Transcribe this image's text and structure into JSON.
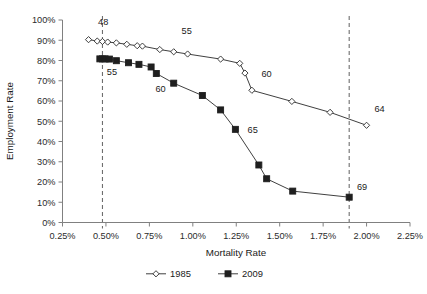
{
  "chart_data": {
    "type": "line",
    "title": "",
    "xlabel": "Mortality Rate",
    "ylabel": "Employment Rate",
    "xlim": [
      0.25,
      2.25
    ],
    "ylim": [
      0,
      100
    ],
    "grid": false,
    "legend_position": "bottom",
    "x_tick_labels": [
      "0.25%",
      "0.50%",
      "0.75%",
      "1.00%",
      "1.25%",
      "1.50%",
      "1.75%",
      "2.00%",
      "2.25%"
    ],
    "x_tick_values": [
      0.25,
      0.5,
      0.75,
      1.0,
      1.25,
      1.5,
      1.75,
      2.0,
      2.25
    ],
    "y_tick_labels": [
      "0%",
      "10%",
      "20%",
      "30%",
      "40%",
      "50%",
      "60%",
      "70%",
      "80%",
      "90%",
      "100%"
    ],
    "y_tick_values": [
      0,
      10,
      20,
      30,
      40,
      50,
      60,
      70,
      80,
      90,
      100
    ],
    "series": [
      {
        "name": "1985",
        "marker": "open-diamond",
        "points": [
          {
            "x": 0.4,
            "y": 90.3
          },
          {
            "x": 0.45,
            "y": 89.6
          },
          {
            "x": 0.48,
            "y": 89.4
          },
          {
            "x": 0.51,
            "y": 89.1
          },
          {
            "x": 0.56,
            "y": 88.7
          },
          {
            "x": 0.62,
            "y": 88.0
          },
          {
            "x": 0.68,
            "y": 87.3
          },
          {
            "x": 0.71,
            "y": 87.1
          },
          {
            "x": 0.81,
            "y": 85.4
          },
          {
            "x": 0.89,
            "y": 84.3
          },
          {
            "x": 0.97,
            "y": 83.2
          },
          {
            "x": 1.16,
            "y": 80.7
          },
          {
            "x": 1.27,
            "y": 78.6
          },
          {
            "x": 1.3,
            "y": 73.8
          },
          {
            "x": 1.34,
            "y": 65.3
          },
          {
            "x": 1.57,
            "y": 59.8
          },
          {
            "x": 1.79,
            "y": 54.4
          },
          {
            "x": 2.0,
            "y": 48.0
          }
        ]
      },
      {
        "name": "2009",
        "marker": "filled-square",
        "points": [
          {
            "x": 0.465,
            "y": 80.8
          },
          {
            "x": 0.48,
            "y": 80.8
          },
          {
            "x": 0.495,
            "y": 80.8
          },
          {
            "x": 0.52,
            "y": 80.7
          },
          {
            "x": 0.56,
            "y": 79.9
          },
          {
            "x": 0.63,
            "y": 78.9
          },
          {
            "x": 0.69,
            "y": 78.1
          },
          {
            "x": 0.76,
            "y": 76.8
          },
          {
            "x": 0.79,
            "y": 73.6
          },
          {
            "x": 0.89,
            "y": 68.8
          },
          {
            "x": 1.055,
            "y": 62.7
          },
          {
            "x": 1.16,
            "y": 55.6
          },
          {
            "x": 1.245,
            "y": 46.0
          },
          {
            "x": 1.38,
            "y": 28.4
          },
          {
            "x": 1.425,
            "y": 21.6
          },
          {
            "x": 1.575,
            "y": 15.5
          },
          {
            "x": 1.9,
            "y": 12.5
          }
        ]
      }
    ],
    "reference_lines": [
      {
        "orientation": "vertical",
        "x": 0.48,
        "style": "dashed"
      },
      {
        "orientation": "vertical",
        "x": 1.9,
        "style": "dashed"
      }
    ],
    "annotations": [
      {
        "text": "48",
        "x": 0.455,
        "y": 97.5
      },
      {
        "text": "55",
        "x": 0.505,
        "y": 73.0
      },
      {
        "text": "55",
        "x": 0.935,
        "y": 93.0
      },
      {
        "text": "60",
        "x": 0.785,
        "y": 64.5
      },
      {
        "text": "60",
        "x": 1.395,
        "y": 72.0
      },
      {
        "text": "64",
        "x": 2.045,
        "y": 54.5
      },
      {
        "text": "65",
        "x": 1.315,
        "y": 44.0
      },
      {
        "text": "69",
        "x": 1.945,
        "y": 16.0
      }
    ]
  }
}
